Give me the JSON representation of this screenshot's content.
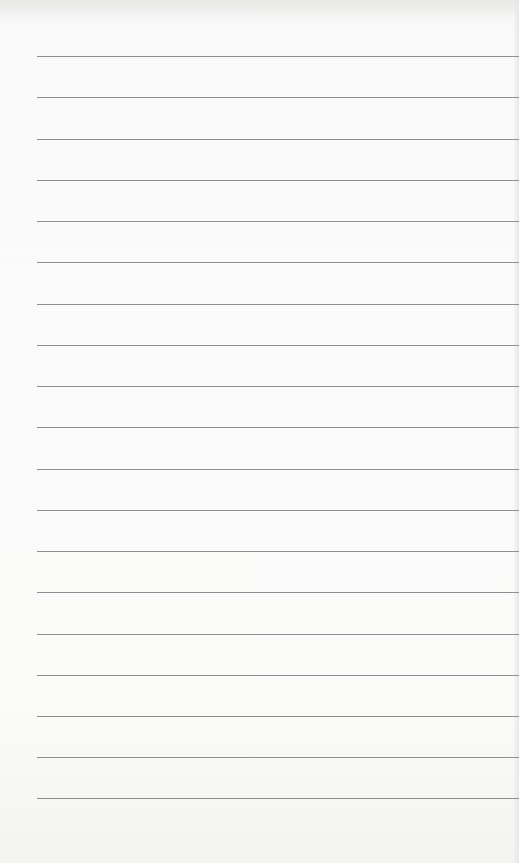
{
  "document": {
    "type": "lined-paper",
    "background_color": "#f9f9f8",
    "rule_color": "#8f8f8f",
    "rule_left_px": 37,
    "rules_y": [
      56,
      97,
      139,
      180,
      221,
      262,
      304,
      345,
      386,
      427,
      469,
      510,
      551,
      592,
      634,
      675,
      716,
      757,
      798
    ]
  }
}
